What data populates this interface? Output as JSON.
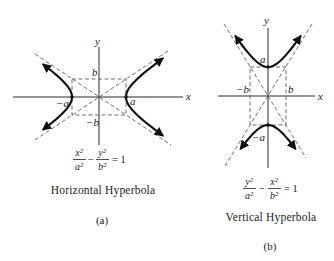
{
  "figure": {
    "panels": [
      {
        "id": "a",
        "axis_labels": {
          "x": "x",
          "y": "y"
        },
        "point_labels": {
          "a": "a",
          "neg_a": "−a",
          "b": "b",
          "neg_b": "−b"
        },
        "equation": {
          "num1": "x²",
          "den1": "a²",
          "op": "−",
          "num2": "y²",
          "den2": "b²",
          "rhs": "= 1"
        },
        "title": "Horizontal Hyperbola",
        "caption": "(a)"
      },
      {
        "id": "b",
        "axis_labels": {
          "x": "x",
          "y": "y"
        },
        "point_labels": {
          "a": "a",
          "neg_a": "−a",
          "b": "b",
          "neg_b": "−b"
        },
        "equation": {
          "num1": "y²",
          "den1": "a²",
          "op": "−",
          "num2": "x²",
          "den2": "b²",
          "rhs": "= 1"
        },
        "title": "Vertical Hyperbola",
        "caption": "(b)"
      }
    ]
  }
}
